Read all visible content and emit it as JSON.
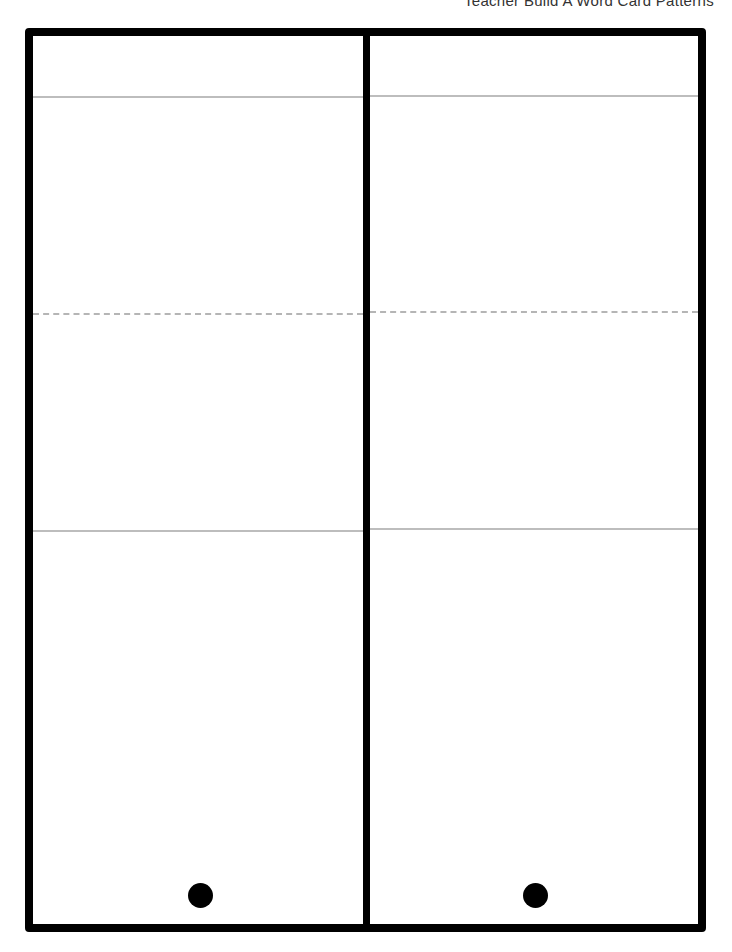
{
  "header": {
    "title": "Teacher Build A Word Card Patterns"
  },
  "cards": [
    {
      "name": "left-card",
      "hole": "punch-hole"
    },
    {
      "name": "right-card",
      "hole": "punch-hole"
    }
  ],
  "colors": {
    "border": "#000000",
    "guide_line": "#bdbdbd",
    "fold_line": "#b5b5b5"
  }
}
